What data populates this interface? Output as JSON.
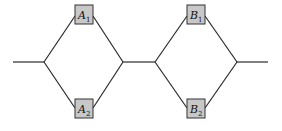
{
  "diagram": {
    "type": "series-parallel reliability network",
    "blocks": [
      {
        "id": "A",
        "components": [
          {
            "letter": "A",
            "subscript": "1",
            "position": "top"
          },
          {
            "letter": "A",
            "subscript": "2",
            "position": "bottom"
          }
        ]
      },
      {
        "id": "B",
        "components": [
          {
            "letter": "B",
            "subscript": "1",
            "position": "top"
          },
          {
            "letter": "B",
            "subscript": "2",
            "position": "bottom"
          }
        ]
      }
    ],
    "colors": {
      "line": "#2a2a2a",
      "box_fill": "#c8c8c8",
      "box_stroke": "#333333",
      "background": "#ffffff"
    }
  }
}
